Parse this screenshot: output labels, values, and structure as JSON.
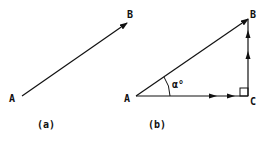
{
  "figure_a": {
    "caption": "(a)",
    "start_label": "A",
    "end_label": "B"
  },
  "figure_b": {
    "caption": "(b)",
    "vertex_a": "A",
    "vertex_b": "B",
    "vertex_c": "C",
    "angle_label": "α°"
  },
  "colors": {
    "stroke": "#111111",
    "background": "#ffffff"
  }
}
